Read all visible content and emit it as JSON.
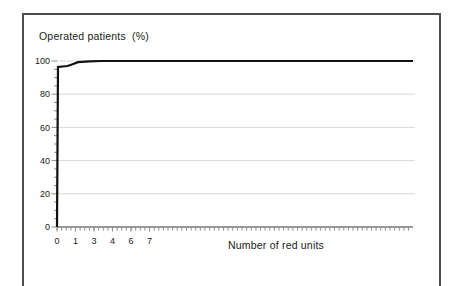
{
  "figure": {
    "title": "Operated patients  (%)",
    "x_axis_label": "Number of red units"
  },
  "chart_data": {
    "type": "line",
    "title": "Operated patients (%)",
    "xlabel": "Number of red units",
    "ylabel": "Operated patients (%)",
    "x_tick_labels": [
      "0",
      "1",
      "3",
      "4",
      "6",
      "7"
    ],
    "x_tick_unit_positions": [
      0,
      1.5,
      3,
      4.5,
      6,
      7.5
    ],
    "y_tick_values": [
      0,
      20,
      40,
      60,
      80,
      100
    ],
    "y_minor_tick_step": 5,
    "ylim": [
      0,
      100
    ],
    "xlim_units": [
      0,
      28.85
    ],
    "grid": "horizontal-light",
    "legend": "none",
    "series": [
      {
        "name": "Cumulative percent of operated patients",
        "color": "#111111",
        "points": [
          [
            0,
            0
          ],
          [
            0.08,
            96.4
          ],
          [
            0.85,
            97.0
          ],
          [
            1.15,
            97.8
          ],
          [
            1.7,
            99.3
          ],
          [
            2.6,
            99.8
          ],
          [
            3.6,
            100
          ],
          [
            28.85,
            100
          ]
        ]
      }
    ]
  },
  "style": {
    "background": "#ffffff",
    "frame_color": "#4d4d4d",
    "line_color": "#111111",
    "grid_color": "#d9d9d9",
    "axis_color": "#333333",
    "tick_color": "#8c8c8c",
    "text_color": "#1a1a1a"
  }
}
